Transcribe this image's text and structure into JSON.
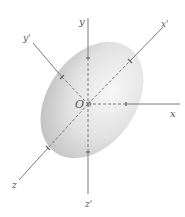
{
  "diagram": {
    "origin_label": "O",
    "axes": [
      {
        "name": "x",
        "label": "x"
      },
      {
        "name": "y",
        "label": "y"
      },
      {
        "name": "z",
        "label": "z"
      },
      {
        "name": "x-prime",
        "label": "x'"
      },
      {
        "name": "y-prime",
        "label": "y'"
      },
      {
        "name": "z-prime",
        "label": "z'"
      }
    ],
    "colors": {
      "axis_line": "#7a7a7a",
      "ellipsoid_light": "#f4f4f4",
      "ellipsoid_dark": "#bdbdbd",
      "label": "#555555"
    }
  }
}
